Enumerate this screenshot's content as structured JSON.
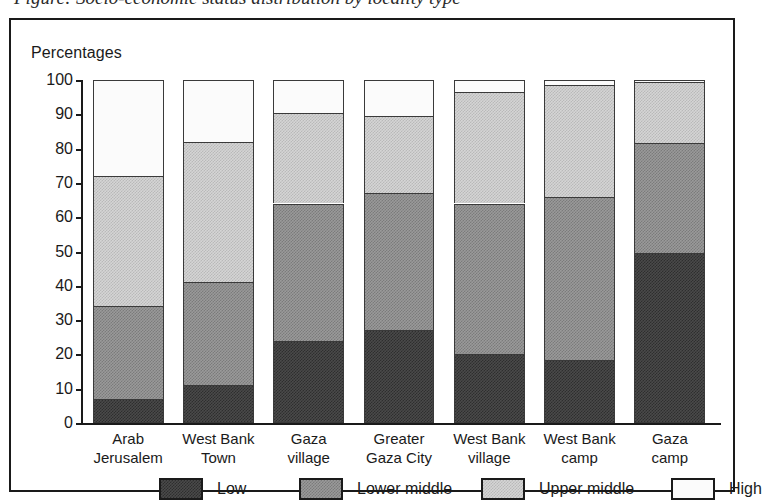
{
  "caption": {
    "text": "Figure: Socio-economic status distribution by locality type"
  },
  "figure": {
    "axis_title": "Percentages"
  },
  "chart_data": {
    "type": "bar",
    "subtype": "stacked-bar-100",
    "title": "",
    "xlabel": "",
    "ylabel": "Percentages",
    "ylim": [
      0,
      100
    ],
    "yticks": [
      0,
      10,
      20,
      30,
      40,
      50,
      60,
      70,
      80,
      90,
      100
    ],
    "ytick_labels": [
      "0",
      "10",
      "20",
      "30",
      "40",
      "50",
      "60",
      "70",
      "80",
      "90",
      "100"
    ],
    "grid": false,
    "legend_position": "bottom",
    "categories": [
      "Arab\nJerusalem",
      "West Bank\nTown",
      "Gaza\nvillage",
      "Greater\nGaza City",
      "West Bank\nvillage",
      "West Bank\ncamp",
      "Gaza\ncamp"
    ],
    "series": [
      {
        "name": "Low",
        "color": "#3a3a3a",
        "values": [
          7,
          11,
          24,
          27,
          20,
          18.5,
          49.5
        ]
      },
      {
        "name": "Lower middle",
        "color": "#8c8c8c",
        "values": [
          27,
          30,
          40,
          40,
          44,
          47.5,
          32
        ]
      },
      {
        "name": "Upper middle",
        "color": "#cccccc",
        "values": [
          38,
          41,
          26.5,
          22.5,
          32.5,
          32.5,
          18
        ]
      },
      {
        "name": "High",
        "color": "#ffffff",
        "values": [
          28,
          18,
          9.5,
          10.5,
          3.5,
          1.5,
          0.5
        ]
      }
    ],
    "cumulative_tops": [
      [
        7,
        34,
        72,
        100
      ],
      [
        11,
        41,
        82,
        100
      ],
      [
        24,
        64,
        90.5,
        100
      ],
      [
        27,
        67,
        89.5,
        100
      ],
      [
        20,
        64,
        96.5,
        100
      ],
      [
        18.5,
        66,
        98.5,
        100
      ],
      [
        49.5,
        81.5,
        99.5,
        100
      ]
    ]
  },
  "legend": {
    "items": [
      {
        "label": "Low",
        "fill": "fill-low"
      },
      {
        "label": "Lower middle",
        "fill": "fill-lowermid"
      },
      {
        "label": "Upper middle",
        "fill": "fill-uppermid"
      },
      {
        "label": "High",
        "fill": "fill-high"
      }
    ]
  }
}
